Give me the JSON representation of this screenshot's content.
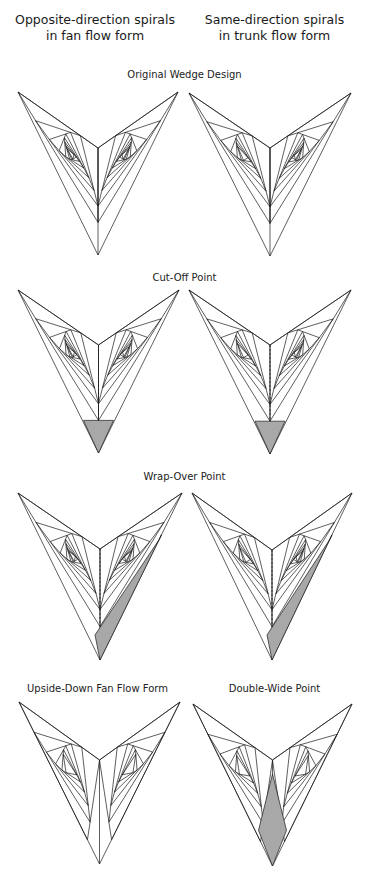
{
  "columns": [
    {
      "line1": "Opposite-direction spirals",
      "line2": "in fan flow form"
    },
    {
      "line1": "Same-direction spirals",
      "line2": "in trunk flow form"
    }
  ],
  "sections": [
    {
      "label": "Original Wedge Design"
    },
    {
      "label": "Cut-Off Point"
    },
    {
      "label": "Wrap-Over Point"
    }
  ],
  "bottom_labels": {
    "left": "Upside-Down Fan Flow Form",
    "right": "Double-Wide Point"
  },
  "colors": {
    "line": "#1a1a1a",
    "shade": "#a8a8a8"
  }
}
